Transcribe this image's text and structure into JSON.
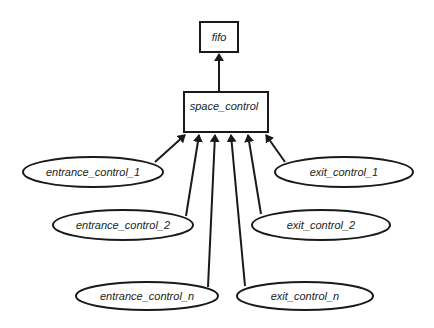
{
  "diagram": {
    "type": "hierarchy",
    "colors": {
      "stroke": "#1a1a1a",
      "text": "#222222",
      "background": "#ffffff"
    },
    "nodes": {
      "fifo": {
        "label": "fifo",
        "shape": "rectangle"
      },
      "space_control": {
        "label": "space_control",
        "shape": "rectangle"
      },
      "entrance_control_1": {
        "label": "entrance_control_1",
        "shape": "ellipse"
      },
      "entrance_control_2": {
        "label": "entrance_control_2",
        "shape": "ellipse"
      },
      "entrance_control_n": {
        "label": "entrance_control_n",
        "shape": "ellipse"
      },
      "exit_control_1": {
        "label": "exit_control_1",
        "shape": "ellipse"
      },
      "exit_control_2": {
        "label": "exit_control_2",
        "shape": "ellipse"
      },
      "exit_control_n": {
        "label": "exit_control_n",
        "shape": "ellipse"
      }
    },
    "edges": [
      {
        "from": "space_control",
        "to": "fifo"
      },
      {
        "from": "entrance_control_1",
        "to": "space_control"
      },
      {
        "from": "entrance_control_2",
        "to": "space_control"
      },
      {
        "from": "entrance_control_n",
        "to": "space_control"
      },
      {
        "from": "exit_control_n",
        "to": "space_control"
      },
      {
        "from": "exit_control_2",
        "to": "space_control"
      },
      {
        "from": "exit_control_1",
        "to": "space_control"
      }
    ]
  }
}
